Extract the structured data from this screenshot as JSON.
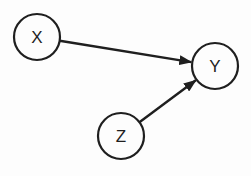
{
  "diagram": {
    "type": "directed-graph",
    "canvas": {
      "width": 251,
      "height": 176
    },
    "colors": {
      "background": "#fdfdfd",
      "stroke": "#1f1f1f",
      "node_fill": "#fdfdfd",
      "label": "#1f1f1f"
    },
    "nodes": [
      {
        "id": "X",
        "label": "X",
        "x": 37,
        "y": 37,
        "r": 23
      },
      {
        "id": "Y",
        "label": "Y",
        "x": 215,
        "y": 66,
        "r": 23
      },
      {
        "id": "Z",
        "label": "Z",
        "x": 121,
        "y": 136,
        "r": 23
      }
    ],
    "edges": [
      {
        "from": "X",
        "to": "Y"
      },
      {
        "from": "Z",
        "to": "Y"
      }
    ]
  }
}
